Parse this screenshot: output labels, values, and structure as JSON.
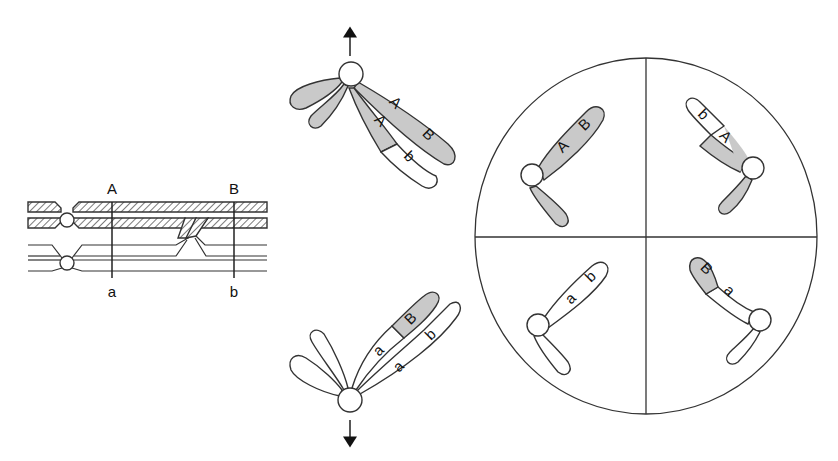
{
  "diagram": {
    "colors": {
      "paternal_fill": "#c9c9c9",
      "maternal_fill": "#ffffff",
      "line": "#333333"
    },
    "crossover_panel": {
      "top_labels": [
        "A",
        "B"
      ],
      "bottom_labels": [
        "a",
        "b"
      ]
    },
    "anaphase_top": {
      "direction": "up",
      "chromatid_labels": [
        "A",
        "B",
        "A",
        "b"
      ]
    },
    "anaphase_bottom": {
      "direction": "down",
      "chromatid_labels": [
        "a",
        "B",
        "a",
        "b"
      ]
    },
    "gametes": [
      {
        "quadrant": "top-left",
        "labels": [
          "A",
          "B"
        ],
        "type": "parental"
      },
      {
        "quadrant": "top-right",
        "labels": [
          "b",
          "A"
        ],
        "type": "recombinant"
      },
      {
        "quadrant": "bottom-left",
        "labels": [
          "a",
          "b"
        ],
        "type": "parental"
      },
      {
        "quadrant": "bottom-right",
        "labels": [
          "B",
          "a"
        ],
        "type": "recombinant"
      }
    ]
  }
}
